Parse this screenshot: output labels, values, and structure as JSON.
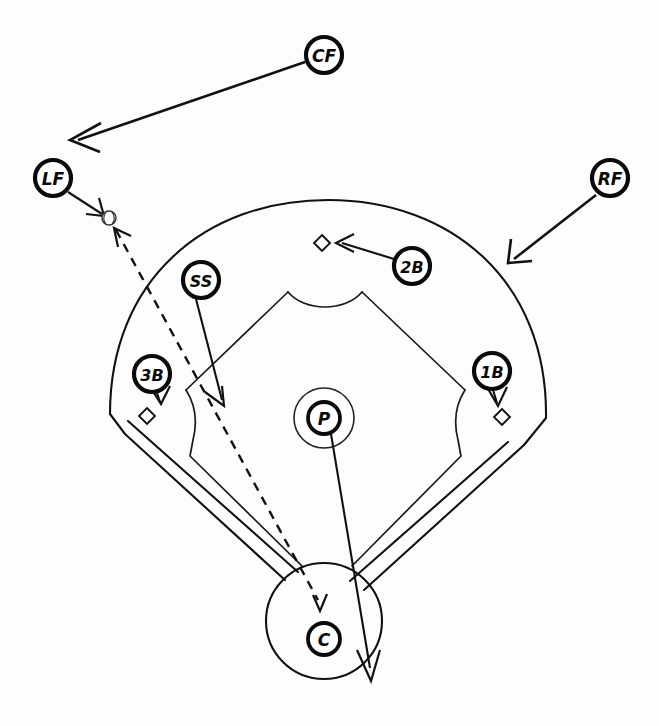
{
  "diagram": {
    "background_color": "#fdfdfc",
    "line_color": "#111111",
    "badge_fill": "#ffffff"
  },
  "players": [
    {
      "id": "cf",
      "label": "CF",
      "name": "center-fielder",
      "cx": 324,
      "cy": 55,
      "r": 18,
      "font_size": 17
    },
    {
      "id": "lf",
      "label": "LF",
      "name": "left-fielder",
      "cx": 53,
      "cy": 178,
      "r": 18,
      "font_size": 17
    },
    {
      "id": "rf",
      "label": "RF",
      "name": "right-fielder",
      "cx": 610,
      "cy": 178,
      "r": 18,
      "font_size": 17
    },
    {
      "id": "2b",
      "label": "2B",
      "name": "second-baseman",
      "cx": 412,
      "cy": 266,
      "r": 18,
      "font_size": 16
    },
    {
      "id": "ss",
      "label": "SS",
      "name": "shortstop",
      "cx": 201,
      "cy": 280,
      "r": 18,
      "font_size": 16
    },
    {
      "id": "3b",
      "label": "3B",
      "name": "third-baseman",
      "cx": 152,
      "cy": 374,
      "r": 18,
      "font_size": 16
    },
    {
      "id": "1b",
      "label": "1B",
      "name": "first-baseman",
      "cx": 492,
      "cy": 371,
      "r": 18,
      "font_size": 16
    },
    {
      "id": "p",
      "label": "P",
      "name": "pitcher",
      "cx": 324,
      "cy": 418,
      "r": 16,
      "font_size": 17
    },
    {
      "id": "c",
      "label": "C",
      "name": "catcher",
      "cx": 324,
      "cy": 639,
      "r": 16,
      "font_size": 17
    }
  ],
  "bases": [
    {
      "id": "second-base",
      "name": "second-base-marker",
      "cx": 322,
      "cy": 243,
      "size": 8
    },
    {
      "id": "third-base",
      "name": "third-base-marker",
      "cx": 147,
      "cy": 416,
      "size": 8
    },
    {
      "id": "first-base",
      "name": "first-base-marker",
      "cx": 502,
      "cy": 417,
      "size": 8
    }
  ],
  "ball": {
    "name": "baseball-marker",
    "label": "baseball",
    "cx": 109,
    "cy": 218,
    "r": 7
  },
  "movements": [
    {
      "id": "cf-route",
      "name": "cf-movement-arrow",
      "from": "CF",
      "to": "left-center gap",
      "style": "solid"
    },
    {
      "id": "lf-route",
      "name": "lf-movement-arrow",
      "from": "LF",
      "to": "ball",
      "style": "solid"
    },
    {
      "id": "rf-route",
      "name": "rf-movement-arrow",
      "from": "RF",
      "to": "right-center backup",
      "style": "solid"
    },
    {
      "id": "2b-route",
      "name": "second-baseman-movement-arrow",
      "from": "2B",
      "to": "second base",
      "style": "solid"
    },
    {
      "id": "ss-route",
      "name": "shortstop-movement-arrow",
      "from": "SS",
      "to": "cutoff position",
      "style": "solid"
    },
    {
      "id": "3b-route",
      "name": "third-baseman-movement-arrow",
      "from": "3B",
      "to": "third base",
      "style": "solid"
    },
    {
      "id": "1b-route",
      "name": "first-baseman-movement-arrow",
      "from": "1B",
      "to": "first base",
      "style": "solid"
    },
    {
      "id": "p-route",
      "name": "pitcher-movement-arrow",
      "from": "P",
      "to": "backup home plate",
      "style": "solid"
    },
    {
      "id": "throw-route",
      "name": "ball-throw-path",
      "from": "ball",
      "to": "home plate",
      "style": "dashed"
    }
  ],
  "field": {
    "outfield_fence": "outfield-arc",
    "infield_dirt": "infield-dirt-boundary",
    "foul_lines": "foul-line-band",
    "home_plate_circle": "home-plate-circle",
    "pitchers_mound": "pitchers-mound-circle"
  }
}
